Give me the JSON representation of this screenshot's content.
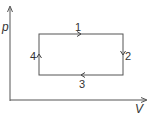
{
  "diagram": {
    "type": "pV-cycle",
    "axes": {
      "y_label": "p",
      "x_label": "V"
    },
    "cycle": {
      "shape": "rectangle",
      "direction": "clockwise",
      "segments": [
        {
          "label": "1",
          "side": "top",
          "direction": "right"
        },
        {
          "label": "2",
          "side": "right",
          "direction": "down"
        },
        {
          "label": "3",
          "side": "bottom",
          "direction": "left"
        },
        {
          "label": "4",
          "side": "left",
          "direction": "up"
        }
      ]
    },
    "colors": {
      "line": "#555555",
      "text": "#333333"
    }
  }
}
